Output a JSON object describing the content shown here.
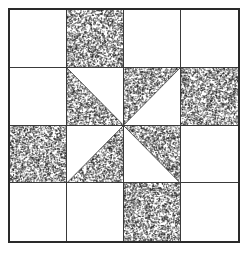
{
  "figure": {
    "width": 248,
    "height": 254,
    "background_color": "#ffffff",
    "border_color": "#2a2a2a",
    "grid_line_color": "#3a3a3a",
    "stipple_color": "#1a1a1a",
    "plain_color": "#ffffff",
    "rows": 4,
    "columns": 4
  },
  "chart_data": {
    "type": "heatmap",
    "xlabel": "",
    "ylabel": "",
    "categories": [
      "column-1",
      "column-2",
      "column-3",
      "column-4"
    ],
    "row_labels": [
      "row-1",
      "row-2",
      "row-3",
      "row-4"
    ],
    "legend": [
      "plain",
      "stipple",
      "half-stipple"
    ],
    "grid": true,
    "cells": [
      {
        "row": 1,
        "col": 1,
        "fill": "plain",
        "name": "patch-r1c1"
      },
      {
        "row": 1,
        "col": 2,
        "fill": "stipple",
        "name": "patch-r1c2"
      },
      {
        "row": 1,
        "col": 3,
        "fill": "plain",
        "name": "patch-r1c3"
      },
      {
        "row": 1,
        "col": 4,
        "fill": "plain",
        "name": "patch-r1c4"
      },
      {
        "row": 2,
        "col": 1,
        "fill": "plain",
        "name": "patch-r2c1"
      },
      {
        "row": 2,
        "col": 2,
        "fill": "triangle",
        "corner": "lower-left",
        "name": "patch-r2c2"
      },
      {
        "row": 2,
        "col": 3,
        "fill": "triangle",
        "corner": "upper-left",
        "name": "patch-r2c3"
      },
      {
        "row": 2,
        "col": 4,
        "fill": "stipple",
        "name": "patch-r2c4"
      },
      {
        "row": 3,
        "col": 1,
        "fill": "stipple",
        "name": "patch-r3c1"
      },
      {
        "row": 3,
        "col": 2,
        "fill": "triangle",
        "corner": "lower-right",
        "name": "patch-r3c2"
      },
      {
        "row": 3,
        "col": 3,
        "fill": "triangle",
        "corner": "upper-right",
        "name": "patch-r3c3"
      },
      {
        "row": 3,
        "col": 4,
        "fill": "plain",
        "name": "patch-r3c4"
      },
      {
        "row": 4,
        "col": 1,
        "fill": "plain",
        "name": "patch-r4c1"
      },
      {
        "row": 4,
        "col": 2,
        "fill": "plain",
        "name": "patch-r4c2"
      },
      {
        "row": 4,
        "col": 3,
        "fill": "stipple",
        "name": "patch-r4c3"
      },
      {
        "row": 4,
        "col": 4,
        "fill": "plain",
        "name": "patch-r4c4"
      }
    ]
  }
}
